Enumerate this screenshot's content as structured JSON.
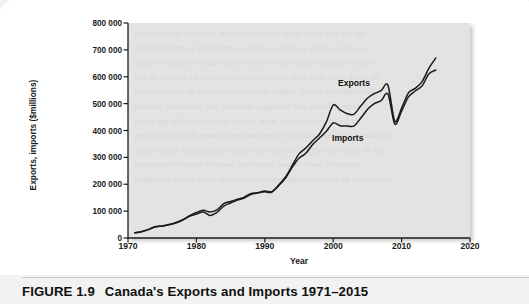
{
  "figure": {
    "number_label": "FIGURE 1.9",
    "caption_title": "Canada's Exports and Imports 1971–2015"
  },
  "ghost": {
    "bleed_text": "lorem ipsum dolor sit amet consectetur adipiscing elit sed do\neiusmod tempor incididunt ut labore et dolore magna aliqua ut\nenim ad minim veniam quis nostrud exercitation ullamco laboris\nnisi ut aliquip ex ea commodo consequat duis aute irure dolor in\nreprehenderit in voluptate velit esse cillum dolore eu fugiat nulla\npariatur excepteur sint occaecat cupidatat non proident sunt in\nculpa qui officia deserunt mollit anim id est laborum sed ut\nperspiciatis unde omnis iste natus error sit voluptatem accusantium\ndoloremque laudantium totam rem aperiam eaque ipsa quae ab illo\ninventore veritatis et quasi architecto beatae vitae dicta sunt\nexplicabo nemo enim ipsam voluptatem quia voluptas sit aspernatur"
  },
  "chart_data": {
    "type": "line",
    "title": "Canada's Exports and Imports 1971–2015",
    "xlabel": "Year",
    "ylabel": "Exports, imports ($millions)",
    "xlim": [
      1970,
      2020
    ],
    "ylim": [
      0,
      800000
    ],
    "xticks": [
      1970,
      1980,
      1990,
      2000,
      2010,
      2020
    ],
    "xtick_labels": [
      "1970",
      "1980",
      "1990",
      "2000",
      "2010",
      "2020"
    ],
    "yticks": [
      0,
      100000,
      200000,
      300000,
      400000,
      500000,
      600000,
      700000,
      800000
    ],
    "ytick_labels": [
      "0",
      "100 000",
      "200 000",
      "300 000",
      "400 000",
      "500 000",
      "600 000",
      "700 000",
      "800 000"
    ],
    "grid": false,
    "legend_position": "inline-annotation",
    "line_color": "#1a1a1a",
    "plot_background": "#e3e3e3",
    "x": [
      1971,
      1972,
      1973,
      1974,
      1975,
      1976,
      1977,
      1978,
      1979,
      1980,
      1981,
      1982,
      1983,
      1984,
      1985,
      1986,
      1987,
      1988,
      1989,
      1990,
      1991,
      1992,
      1993,
      1994,
      1995,
      1996,
      1997,
      1998,
      1999,
      2000,
      2001,
      2002,
      2003,
      2004,
      2005,
      2006,
      2007,
      2008,
      2009,
      2010,
      2011,
      2012,
      2013,
      2014,
      2015
    ],
    "series": [
      {
        "name": "Exports",
        "annotation": "Exports",
        "values": [
          20000,
          24000,
          32000,
          42000,
          44000,
          50000,
          58000,
          68000,
          83000,
          95000,
          103000,
          97000,
          105000,
          128000,
          136000,
          144000,
          152000,
          166000,
          168000,
          175000,
          172000,
          196000,
          226000,
          269000,
          313000,
          335000,
          362000,
          387000,
          432000,
          495000,
          477000,
          463000,
          460000,
          490000,
          520000,
          537000,
          548000,
          569000,
          435000,
          483000,
          540000,
          557000,
          582000,
          632000,
          670000
        ]
      },
      {
        "name": "Imports",
        "annotation": "Imports",
        "values": [
          19000,
          23000,
          31000,
          42000,
          45000,
          49000,
          56000,
          67000,
          81000,
          89000,
          97000,
          84000,
          95000,
          119000,
          130000,
          141000,
          149000,
          163000,
          168000,
          172000,
          170000,
          194000,
          222000,
          263000,
          297000,
          315000,
          348000,
          372000,
          397000,
          428000,
          418000,
          417000,
          416000,
          445000,
          478000,
          500000,
          511000,
          536000,
          424000,
          472000,
          525000,
          547000,
          566000,
          611000,
          625000
        ]
      }
    ]
  }
}
